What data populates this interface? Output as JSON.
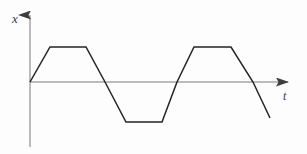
{
  "figure": {
    "title": "",
    "background_color": "#fdfdfd",
    "stroke_color": "#242424",
    "axis_color": "#6b6b6b"
  },
  "axes": {
    "y_axis": {
      "label": "x",
      "icon": "up-arrow-icon",
      "origin_x": 30,
      "top_y": 13,
      "bottom_y": 147
    },
    "x_axis": {
      "label": "t",
      "icon": "right-arrow-icon",
      "origin_y": 82,
      "left_x": 30,
      "right_x": 291
    }
  },
  "chart_data": {
    "type": "line",
    "title": "",
    "xlabel": "t",
    "ylabel": "x",
    "grid": false,
    "legend": null,
    "axis_style": "arrowed",
    "waveform": "trapezoidal periodic",
    "amplitude": 1,
    "period": 147,
    "x": [
      30,
      50,
      86,
      105,
      126,
      162,
      177,
      194,
      231,
      253,
      270
    ],
    "y": [
      0,
      1,
      1,
      0,
      -1,
      -1,
      0,
      1,
      1,
      0,
      -0.75
    ],
    "points_px": [
      [
        30,
        82
      ],
      [
        50,
        47
      ],
      [
        86,
        47
      ],
      [
        105,
        82
      ],
      [
        126,
        122
      ],
      [
        162,
        122
      ],
      [
        177,
        82
      ],
      [
        194,
        47
      ],
      [
        231,
        47
      ],
      [
        253,
        82
      ],
      [
        270,
        118
      ]
    ],
    "xlim": [
      30,
      291
    ],
    "ylim": [
      -1.15,
      1.15
    ],
    "zero_crossings_px": [
      30,
      105,
      177,
      253
    ],
    "top_plateau_y_px": 47,
    "bottom_plateau_y_px": 122,
    "zero_level_y_px": 82,
    "annotations": []
  }
}
